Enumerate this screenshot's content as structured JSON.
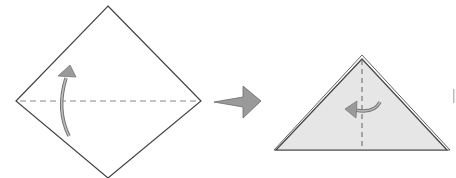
{
  "diagram": {
    "steps": [
      {
        "name": "square-diamond",
        "fold": "valley fold bottom corner up along horizontal diagonal",
        "fold_arrow_direction": "up"
      },
      {
        "name": "triangle",
        "fold": "fold in half along vertical center line",
        "fold_arrow_direction": "left"
      }
    ],
    "transition_arrow": "next-step",
    "colors": {
      "paper_front": "#ffffff",
      "paper_back": "#e6e6e6",
      "outline": "#444444",
      "crease": "#888888",
      "arrow_fill": "#9a9a9a",
      "arrow_stroke": "#6a6a6a"
    }
  }
}
